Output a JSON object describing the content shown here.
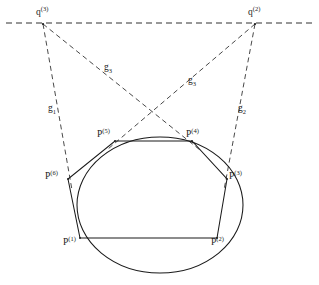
{
  "figure": {
    "background_color": "#ffffff",
    "stroke_color": "#1a1a1a",
    "width": 319,
    "height": 285
  },
  "labels": {
    "q3": {
      "base": "q",
      "sup": "(3)",
      "text": "q(3)",
      "x": 36,
      "y": 8
    },
    "q2": {
      "base": "q",
      "sup": "(2)",
      "text": "q(2)",
      "x": 248,
      "y": 8
    },
    "g1": {
      "base": "g",
      "sub": "1",
      "text": "g1",
      "x": 48,
      "y": 108
    },
    "g2": {
      "base": "g",
      "sub": "2",
      "text": "g2",
      "x": 238,
      "y": 108
    },
    "g3a": {
      "base": "g",
      "sub": "3",
      "text": "g3",
      "x": 104,
      "y": 67
    },
    "g3b": {
      "base": "g",
      "sub": "3",
      "text": "g3",
      "x": 188,
      "y": 80
    },
    "p1": {
      "base": "P",
      "sup": "(1)",
      "text": "P(1)",
      "x": 63,
      "y": 240
    },
    "p2": {
      "base": "P",
      "sup": "(2)",
      "text": "P(2)",
      "x": 211,
      "y": 240
    },
    "p3": {
      "base": "P",
      "sup": "(3)",
      "text": "P(3)",
      "x": 229,
      "y": 172
    },
    "p4": {
      "base": "P",
      "sup": "(4)",
      "text": "P(4)",
      "x": 186,
      "y": 130
    },
    "p5": {
      "base": "P",
      "sup": "(5)",
      "text": "P(5)",
      "x": 97,
      "y": 130
    },
    "p6": {
      "base": "P",
      "sup": "(6)",
      "text": "P(6)",
      "x": 45,
      "y": 172
    }
  },
  "geometry": {
    "ellipse": {
      "cx": 160,
      "cy": 205,
      "rx": 83,
      "ry": 68
    },
    "horizontal_dashed_line": {
      "x1": 6,
      "y1": 23,
      "x2": 312,
      "y2": 23
    },
    "external_points": {
      "q3": {
        "x": 43,
        "y": 24
      },
      "q2": {
        "x": 255,
        "y": 24
      }
    },
    "hexagon_vertices": {
      "p1": {
        "x": 80,
        "y": 238
      },
      "p2": {
        "x": 217,
        "y": 238
      },
      "p3": {
        "x": 227,
        "y": 179
      },
      "p4": {
        "x": 192,
        "y": 141
      },
      "p5": {
        "x": 115,
        "y": 141
      },
      "p6": {
        "x": 68,
        "y": 179
      }
    },
    "dashed_rays": [
      {
        "name": "g1",
        "from": "q3",
        "to": "p6"
      },
      {
        "name": "g2",
        "from": "q2",
        "to": "p3"
      },
      {
        "name": "g3a",
        "from": "q3",
        "to": "p4"
      },
      {
        "name": "g3b",
        "from": "q2",
        "to": "p5"
      }
    ]
  }
}
